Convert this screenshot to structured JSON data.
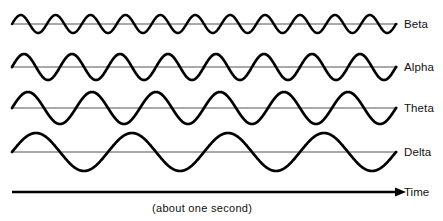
{
  "figure": {
    "background_color": "#ffffff",
    "wave_color": "#000000",
    "baseline_color": "#555555",
    "axis_color": "#000000",
    "width": 443,
    "height": 221
  },
  "axis": {
    "time_label": "Time",
    "caption": "(about one second)",
    "arrow_icon": "arrow-right-icon",
    "line_start_x": 12,
    "line_end_x": 396,
    "line_y": 192
  },
  "chart_data": {
    "type": "line",
    "xlabel": "Time",
    "ylabel": "",
    "annotations": [
      "(about one second)"
    ],
    "grid": false,
    "legend": "right",
    "x": [
      0,
      1
    ],
    "xlim": [
      0,
      1
    ],
    "x_units": "seconds",
    "series": [
      {
        "name": "Beta",
        "label": "Beta",
        "cycles": 11,
        "amplitude_px": 9,
        "baseline_y": 24,
        "frequency_hz": 11,
        "phase": "sine-rising-from-zero"
      },
      {
        "name": "Alpha",
        "label": "Alpha",
        "cycles": 8,
        "amplitude_px": 13,
        "baseline_y": 67,
        "frequency_hz": 8,
        "phase": "sine-rising-from-zero"
      },
      {
        "name": "Theta",
        "label": "Theta",
        "cycles": 6,
        "amplitude_px": 16,
        "baseline_y": 108,
        "frequency_hz": 6,
        "phase": "sine-rising-from-zero"
      },
      {
        "name": "Delta",
        "label": "Delta",
        "cycles": 4,
        "amplitude_px": 19,
        "baseline_y": 152,
        "frequency_hz": 4,
        "phase": "sine-rising-from-zero"
      }
    ],
    "wave_start_x": 12,
    "wave_end_x": 396,
    "baseline_end_x": 398
  },
  "labels": {
    "beta": "Beta",
    "alpha": "Alpha",
    "theta": "Theta",
    "delta": "Delta"
  }
}
